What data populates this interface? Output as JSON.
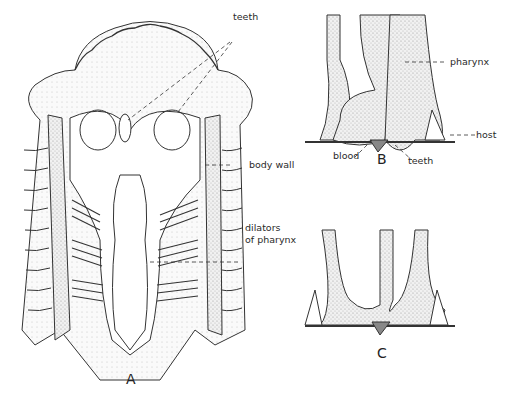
{
  "figures": {
    "A": {
      "letter": "A",
      "labels": {
        "teeth": "teeth",
        "body_wall": "body wall",
        "dilators_1": "dilators",
        "dilators_2": "of pharynx"
      }
    },
    "B": {
      "letter": "B",
      "labels": {
        "pharynx": "pharynx",
        "host": "host",
        "blood": "blood",
        "teeth": "teeth"
      }
    },
    "C": {
      "letter": "C"
    }
  },
  "colors": {
    "ink": "#2a2a2a",
    "stipple": "#d8d8d8",
    "background": "#ffffff"
  }
}
